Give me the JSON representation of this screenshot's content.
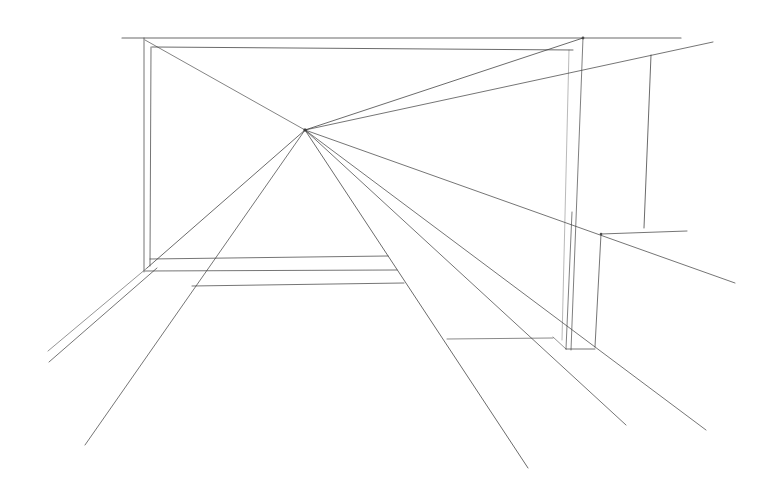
{
  "drawing": {
    "subject": "one-point perspective pencil sketch",
    "background": "#ffffff",
    "stroke_color": "#3a3a3a",
    "vanishing_point": [
      305,
      130
    ],
    "lines": [
      {
        "name": "top-horizon-line",
        "x1": 122,
        "y1": 38,
        "x2": 681,
        "y2": 38,
        "w": 1.1,
        "o": 0.75
      },
      {
        "name": "frame-outer-left",
        "x1": 144,
        "y1": 38,
        "x2": 144,
        "y2": 272,
        "w": 1,
        "o": 0.7
      },
      {
        "name": "frame-inner-top",
        "x1": 152,
        "y1": 47,
        "x2": 573,
        "y2": 50,
        "w": 1,
        "o": 0.75
      },
      {
        "name": "frame-inner-left",
        "x1": 151,
        "y1": 47,
        "x2": 150,
        "y2": 266,
        "w": 1,
        "o": 0.7
      },
      {
        "name": "frame-right-inner-dashed",
        "x1": 569,
        "y1": 50,
        "x2": 562,
        "y2": 340,
        "w": 0.8,
        "o": 0.45
      },
      {
        "name": "frame-right-outer",
        "x1": 583,
        "y1": 38,
        "x2": 571,
        "y2": 350,
        "w": 1,
        "o": 0.65
      },
      {
        "name": "diag-topleft-to-vp",
        "x1": 145,
        "y1": 40,
        "x2": 305,
        "y2": 130,
        "w": 0.9,
        "o": 0.7
      },
      {
        "name": "diag-topright-to-vp",
        "x1": 583,
        "y1": 38,
        "x2": 305,
        "y2": 130,
        "w": 1,
        "o": 0.75
      },
      {
        "name": "long-ray-upper-right",
        "x1": 305,
        "y1": 130,
        "x2": 713,
        "y2": 42,
        "w": 1,
        "o": 0.7
      },
      {
        "name": "ray-right-mid",
        "x1": 305,
        "y1": 130,
        "x2": 735,
        "y2": 283,
        "w": 1,
        "o": 0.7
      },
      {
        "name": "ray-right-low-1",
        "x1": 305,
        "y1": 130,
        "x2": 706,
        "y2": 430,
        "w": 1,
        "o": 0.7
      },
      {
        "name": "ray-right-low-2",
        "x1": 305,
        "y1": 130,
        "x2": 626,
        "y2": 425,
        "w": 1,
        "o": 0.7
      },
      {
        "name": "ray-bottom-center",
        "x1": 305,
        "y1": 130,
        "x2": 528,
        "y2": 468,
        "w": 1,
        "o": 0.75
      },
      {
        "name": "ray-bottom-left",
        "x1": 305,
        "y1": 130,
        "x2": 85,
        "y2": 445,
        "w": 1,
        "o": 0.7
      },
      {
        "name": "ray-left-wall-1",
        "x1": 305,
        "y1": 130,
        "x2": 147,
        "y2": 268,
        "w": 1,
        "o": 0.75
      },
      {
        "name": "floor-left-edge-1",
        "x1": 147,
        "y1": 268,
        "x2": 48,
        "y2": 351,
        "w": 0.9,
        "o": 0.6
      },
      {
        "name": "floor-left-edge-2",
        "x1": 157,
        "y1": 268,
        "x2": 49,
        "y2": 362,
        "w": 1,
        "o": 0.7
      },
      {
        "name": "floor-line-1",
        "x1": 150,
        "y1": 259,
        "x2": 388,
        "y2": 256,
        "w": 1,
        "o": 0.7
      },
      {
        "name": "floor-line-2",
        "x1": 145,
        "y1": 271,
        "x2": 397,
        "y2": 270,
        "w": 1,
        "o": 0.7
      },
      {
        "name": "floor-line-3",
        "x1": 192,
        "y1": 286,
        "x2": 404,
        "y2": 283,
        "w": 1,
        "o": 0.7
      },
      {
        "name": "right-vertical-marker",
        "x1": 651,
        "y1": 55,
        "x2": 644,
        "y2": 228,
        "w": 1,
        "o": 0.75
      },
      {
        "name": "box-top-right",
        "x1": 601,
        "y1": 234,
        "x2": 687,
        "y2": 231,
        "w": 1,
        "o": 0.7
      },
      {
        "name": "box-right-vertical",
        "x1": 601,
        "y1": 234,
        "x2": 595,
        "y2": 347,
        "w": 1,
        "o": 0.7
      },
      {
        "name": "box-bottom",
        "x1": 566,
        "y1": 349,
        "x2": 595,
        "y2": 349,
        "w": 1,
        "o": 0.7
      },
      {
        "name": "box-left-vertical",
        "x1": 572,
        "y1": 212,
        "x2": 566,
        "y2": 349,
        "w": 1,
        "o": 0.65
      },
      {
        "name": "box-base-diagonal",
        "x1": 553,
        "y1": 337,
        "x2": 566,
        "y2": 349,
        "w": 0.9,
        "o": 0.6
      },
      {
        "name": "floor-short-horizontal",
        "x1": 447,
        "y1": 339,
        "x2": 553,
        "y2": 338,
        "w": 1,
        "o": 0.6
      }
    ],
    "marks": [
      {
        "name": "vanishing-point-mark",
        "cx": 305,
        "cy": 130,
        "r": 1.8
      },
      {
        "name": "corner-mark-top-right",
        "cx": 583,
        "cy": 38,
        "r": 1.4
      },
      {
        "name": "corner-mark-box",
        "cx": 601,
        "cy": 234,
        "r": 1.3
      }
    ]
  }
}
